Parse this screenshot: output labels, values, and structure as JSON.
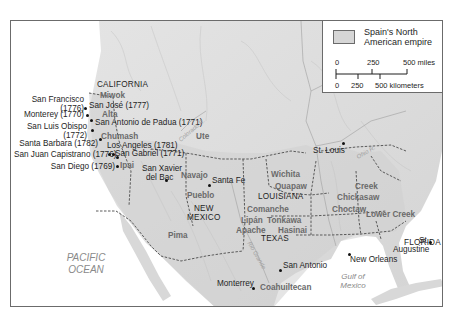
{
  "legend": {
    "swatch_label_line1": "Spain's North",
    "swatch_label_line2": "American empire",
    "swatch_color": "#d6d6d6",
    "scale_miles": [
      "0",
      "250",
      "500 miles"
    ],
    "scale_km": [
      "0",
      "250",
      "500 kilometers"
    ]
  },
  "regions": {
    "california": "CALIFORNIA",
    "new_mexico_1": "NEW",
    "new_mexico_2": "MEXICO",
    "louisiana": "LOUISIANA",
    "texas": "TEXAS",
    "florida": "FLORIDA"
  },
  "tribes": {
    "miwok": "Miwok",
    "alta": "Alta",
    "chumash": "Chumash",
    "ipai": "Ipai",
    "ute": "Ute",
    "navajo": "Navajo",
    "pueblo": "Pueblo",
    "pima": "Pima",
    "wichita": "Wichita",
    "quapaw": "Quapaw",
    "creek": "Creek",
    "chickasaw": "Chickasaw",
    "choctaw": "Choctaw",
    "lower_creek": "Lower Creek",
    "comanche": "Comanche",
    "tonkawa": "Tonkawa",
    "hasinai": "Hasinai",
    "lipan": "Lipán",
    "apache": "Apache",
    "coahuiltecan": "Coahuiltecan"
  },
  "places": {
    "san_francisco_1": "San Francisco",
    "san_francisco_2": "(1776)",
    "san_jose": "San José (1777)",
    "monterey_ca": "Monterey (1770)",
    "san_antonio_padua": "San Antonio de Padua (1771)",
    "san_luis_obispo_1": "San Luis Obispo",
    "san_luis_obispo_2": "(1772)",
    "los_angeles": "Los Angeles (1781)",
    "santa_barbara": "Santa Barbara (1782)",
    "san_gabriel": "San Gabriel (1771)",
    "san_juan_capistrano": "San Juan Capistrano (1776)",
    "san_diego": "San Diego (1769)",
    "san_xavier_1": "San Xavier",
    "san_xavier_2": "del Bac",
    "santa_fe": "Santa Fe",
    "st_louis": "St. Louis",
    "san_antonio_tx": "San Antonio",
    "new_orleans": "New Orleans",
    "st_augustine_1": "St.",
    "st_augustine_2": "Augustine",
    "monterrey_mx": "Monterrey"
  },
  "water": {
    "pacific_1": "PACIFIC",
    "pacific_2": "OCEAN",
    "gulf_1": "Gulf of",
    "gulf_2": "Mexico"
  },
  "rivers": {
    "colorado": "Colorado R.",
    "ohio": "Ohio R.",
    "rio_grande": "Rio Grande"
  },
  "colors": {
    "land": "#dcdcdc",
    "empire_fill": "#d2d2d2",
    "border_dash": "#5a5a5a",
    "ocean": "#ffffff",
    "tribe_text": "#6a6a6a"
  }
}
